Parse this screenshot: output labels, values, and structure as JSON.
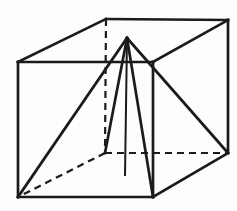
{
  "figure": {
    "name": "Pyramid inscribed in a cube",
    "canvas": {
      "width": 237,
      "height": 211
    },
    "style": {
      "stroke": "#1b1b1b",
      "background": "#fdfdfd",
      "solid_width": 2.7,
      "dashed_width": 2.2,
      "axis_width": 2.0,
      "dash_pattern": "7 5"
    },
    "points": {
      "FTL": [
        18,
        62
      ],
      "FTR": [
        153,
        62
      ],
      "FBR": [
        153,
        197
      ],
      "FBL": [
        18,
        197
      ],
      "BTL": [
        106,
        19
      ],
      "BTR": [
        228,
        20
      ],
      "BBR": [
        228,
        153
      ],
      "BBL": [
        105,
        153
      ],
      "apex": [
        127,
        38
      ],
      "base_center": [
        125,
        176
      ]
    },
    "edges": [
      {
        "name": "cube-edge-front-top",
        "from": "FTL",
        "to": "FTR",
        "kind": "solid"
      },
      {
        "name": "cube-edge-front-right",
        "from": "FTR",
        "to": "FBR",
        "kind": "solid"
      },
      {
        "name": "cube-edge-front-bottom",
        "from": "FBL",
        "to": "FBR",
        "kind": "solid"
      },
      {
        "name": "cube-edge-front-left",
        "from": "FTL",
        "to": "FBL",
        "kind": "solid"
      },
      {
        "name": "cube-edge-top-left",
        "from": "FTL",
        "to": "BTL",
        "kind": "solid"
      },
      {
        "name": "cube-edge-top-right",
        "from": "FTR",
        "to": "BTR",
        "kind": "solid"
      },
      {
        "name": "cube-edge-top-back",
        "from": "BTL",
        "to": "BTR",
        "kind": "solid"
      },
      {
        "name": "cube-edge-back-right-vertical",
        "from": "BTR",
        "to": "BBR",
        "kind": "solid"
      },
      {
        "name": "cube-edge-bottom-right",
        "from": "FBR",
        "to": "BBR",
        "kind": "solid"
      },
      {
        "name": "cube-edge-back-left-vertical",
        "from": "BTL",
        "to": "BBL",
        "kind": "dashed"
      },
      {
        "name": "cube-edge-bottom-back",
        "from": "BBL",
        "to": "BBR",
        "kind": "dashed"
      },
      {
        "name": "cube-edge-bottom-left",
        "from": "BBL",
        "to": "FBL",
        "kind": "dashed"
      },
      {
        "name": "pyramid-edge-apex-front-bottom-left",
        "from": "apex",
        "to": "FBL",
        "kind": "solid"
      },
      {
        "name": "pyramid-edge-apex-back-bottom-left",
        "from": "apex",
        "to": "BBL",
        "kind": "solid"
      },
      {
        "name": "pyramid-edge-apex-front-bottom-right",
        "from": "apex",
        "to": "FBR",
        "kind": "solid"
      },
      {
        "name": "pyramid-edge-apex-back-bottom-right",
        "from": "apex",
        "to": "BBR",
        "kind": "solid"
      },
      {
        "name": "pyramid-height-axis",
        "from": "apex",
        "to": "base_center",
        "kind": "axis"
      }
    ]
  }
}
